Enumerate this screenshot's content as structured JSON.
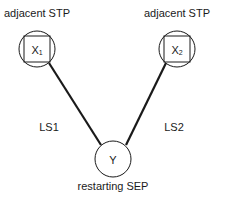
{
  "diagram": {
    "nodes": [
      {
        "id": "X1",
        "symbol": "X",
        "subscript": "1",
        "label": "adjacent STP",
        "shape": "circle-with-square"
      },
      {
        "id": "X2",
        "symbol": "X",
        "subscript": "2",
        "label": "adjacent STP",
        "shape": "circle-with-square"
      },
      {
        "id": "Y",
        "symbol": "Y",
        "label": "restarting SEP",
        "shape": "circle"
      }
    ],
    "edges": [
      {
        "from": "X1",
        "to": "Y",
        "label": "LS1"
      },
      {
        "from": "X2",
        "to": "Y",
        "label": "LS2"
      }
    ],
    "colors": {
      "stroke": "#1a1a1a",
      "background": "#ffffff"
    }
  }
}
